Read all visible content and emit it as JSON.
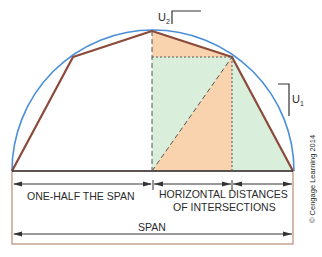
{
  "labels": {
    "u2": "U",
    "u2_sub": "2",
    "u1": "U",
    "u1_sub": "1",
    "one_half_span": "ONE-HALF THE SPAN",
    "horizontal_line1": "HORIZONTAL DISTANCES",
    "horizontal_line2": "OF INTERSECTIONS",
    "span": "SPAN",
    "copyright": "© Cengage Learning 2014"
  },
  "colors": {
    "arc": "#4a8fd8",
    "polygon": "#8b4a3a",
    "orange_fill": "#f8d3ad",
    "green_fill": "#d9efdc",
    "box": "#b98a78",
    "line": "#333333"
  }
}
